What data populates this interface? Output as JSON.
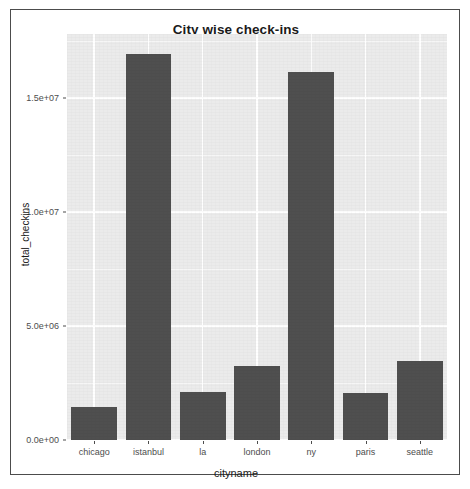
{
  "chart_data": {
    "type": "bar",
    "title": "City wise check-ins",
    "xlabel": "cityname",
    "ylabel": "total_checkins",
    "categories": [
      "chicago",
      "istanbul",
      "la",
      "london",
      "ny",
      "paris",
      "seattle"
    ],
    "values": [
      1450000,
      16940000,
      2120000,
      3250000,
      16120000,
      2070000,
      3480000
    ],
    "ylim": [
      0,
      17800000
    ],
    "ytick_values": [
      0,
      5000000,
      10000000,
      15000000
    ],
    "ytick_labels": [
      "0.0e+00",
      "5.0e+06",
      "1.0e+07",
      "1.5e+07"
    ],
    "grid": true,
    "legend": "none",
    "bar_color": "#4f4f4f",
    "panel_color": "#ebebeb",
    "gridline_color": "#ffffff"
  }
}
